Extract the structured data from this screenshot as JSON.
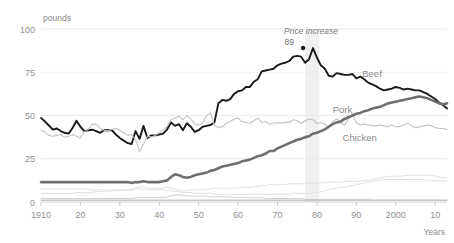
{
  "chart_data": {
    "type": "line",
    "title": "",
    "xlabel": "Years",
    "ylabel": "pounds",
    "xlim": [
      1910,
      2013
    ],
    "ylim": [
      0,
      100
    ],
    "grid": true,
    "legend": "inline-labels",
    "x_ticks": [
      {
        "value": 1910,
        "label": "1910"
      },
      {
        "value": 1920,
        "label": "20"
      },
      {
        "value": 1930,
        "label": "30"
      },
      {
        "value": 1940,
        "label": "40"
      },
      {
        "value": 1950,
        "label": "50"
      },
      {
        "value": 1960,
        "label": "60"
      },
      {
        "value": 1970,
        "label": "70"
      },
      {
        "value": 1980,
        "label": "80"
      },
      {
        "value": 1990,
        "label": "90"
      },
      {
        "value": 2000,
        "label": "2000"
      },
      {
        "value": 2010,
        "label": "10"
      }
    ],
    "y_ticks": [
      {
        "value": 0,
        "label": "0"
      },
      {
        "value": 25,
        "label": "25"
      },
      {
        "value": 50,
        "label": "50"
      },
      {
        "value": 75,
        "label": "75"
      },
      {
        "value": 100,
        "label": "100"
      }
    ],
    "annotations": [
      {
        "name": "price-increase",
        "text": "Price increase",
        "x": 1978.5,
        "y": 97,
        "style": "italic"
      },
      {
        "name": "beef-peak-value",
        "text": "89",
        "x": 1974.2,
        "y": 90.5,
        "marker": true,
        "marker_x": 1976.5,
        "marker_y": 89
      }
    ],
    "shaded_band": {
      "x_start": 1977.0,
      "x_end": 1980.6,
      "color": "#f0f0f0"
    },
    "series": [
      {
        "name": "Beef",
        "label": "Beef",
        "color": "#1a1a1a",
        "width": 1.9,
        "label_x": 1991.5,
        "label_y": 72.5,
        "values": [
          48.6,
          46.5,
          44.2,
          41.8,
          42.5,
          41.0,
          40.0,
          39.5,
          42.8,
          47.0,
          43.5,
          41.0,
          41.5,
          41.8,
          41.0,
          40.0,
          41.5,
          41.5,
          41.5,
          39.0,
          37.0,
          35.5,
          34.0,
          33.5,
          41.0,
          36.5,
          44.0,
          37.0,
          38.5,
          38.5,
          39.0,
          39.5,
          42.0,
          46.0,
          44.0,
          45.0,
          41.5,
          45.5,
          43.5,
          40.5,
          41.5,
          43.5,
          44.0,
          44.5,
          46.0,
          57.0,
          59.0,
          58.5,
          59.5,
          62.5,
          64.0,
          64.5,
          66.5,
          66.5,
          69.5,
          71.0,
          75.5,
          76.0,
          76.5,
          77.0,
          79.0,
          80.0,
          80.5,
          81.5,
          84.0,
          84.5,
          84.0,
          80.5,
          82.5,
          89.0,
          83.5,
          79.0,
          77.0,
          73.0,
          72.5,
          74.5,
          74.0,
          73.5,
          73.5,
          74.0,
          71.5,
          72.5,
          71.0,
          69.0,
          68.0,
          67.0,
          65.5,
          64.5,
          65.0,
          65.5,
          66.5,
          66.0,
          65.0,
          65.5,
          65.0,
          64.5,
          64.5,
          63.5,
          62.5,
          61.0,
          59.5,
          57.5,
          56.0,
          54.0
        ]
      },
      {
        "name": "Pork",
        "label": "Pork",
        "color": "#c2c2c2",
        "width": 1.1,
        "label_x": 1984.0,
        "label_y": 51.5,
        "values": [
          41.5,
          40.5,
          38.5,
          38.0,
          38.5,
          39.0,
          37.5,
          38.0,
          39.0,
          38.0,
          37.0,
          40.5,
          42.0,
          45.0,
          45.0,
          42.5,
          41.5,
          41.0,
          42.0,
          42.5,
          41.5,
          40.0,
          38.5,
          39.0,
          36.0,
          29.0,
          33.5,
          38.0,
          37.5,
          38.5,
          40.0,
          41.5,
          44.0,
          47.5,
          48.5,
          49.5,
          47.5,
          50.0,
          48.0,
          45.0,
          44.5,
          45.5,
          50.0,
          51.5,
          44.5,
          43.0,
          43.5,
          45.5,
          46.5,
          48.0,
          48.5,
          46.5,
          46.0,
          45.5,
          47.0,
          48.5,
          46.0,
          46.5,
          45.0,
          45.5,
          46.0,
          45.5,
          46.0,
          46.0,
          47.5,
          47.0,
          45.5,
          47.0,
          48.0,
          47.5,
          45.5,
          46.0,
          45.0,
          43.0,
          46.5,
          48.0,
          46.0,
          44.5,
          48.0,
          51.0,
          46.0,
          44.5,
          45.0,
          44.5,
          44.0,
          44.0,
          44.5,
          44.0,
          43.5,
          44.5,
          43.5,
          43.5,
          44.5,
          45.5,
          44.0,
          43.0,
          43.5,
          44.0,
          44.5,
          44.0,
          43.0,
          42.5,
          42.5,
          42.0
        ]
      },
      {
        "name": "Chicken",
        "label": "Chicken",
        "color": "#6e6e6e",
        "width": 2.6,
        "label_x": 1986.5,
        "label_y": 35.5,
        "values": [
          11.5,
          11.5,
          11.5,
          11.5,
          11.5,
          11.5,
          11.5,
          11.5,
          11.5,
          11.5,
          11.5,
          11.5,
          11.5,
          11.5,
          11.5,
          11.5,
          11.5,
          11.5,
          11.5,
          11.5,
          11.5,
          11.5,
          11.5,
          11.0,
          11.5,
          11.5,
          12.0,
          11.5,
          11.5,
          11.5,
          11.5,
          12.0,
          12.5,
          14.5,
          16.0,
          15.5,
          14.5,
          14.0,
          14.5,
          15.5,
          16.0,
          16.5,
          17.0,
          18.0,
          18.5,
          19.5,
          20.5,
          21.0,
          21.5,
          22.0,
          22.5,
          23.5,
          24.0,
          24.5,
          25.5,
          26.5,
          27.0,
          28.0,
          29.5,
          29.5,
          31.0,
          32.0,
          33.0,
          34.0,
          35.0,
          36.0,
          36.5,
          37.5,
          38.0,
          39.5,
          40.0,
          41.0,
          42.0,
          43.5,
          45.0,
          46.0,
          46.5,
          48.0,
          49.0,
          50.0,
          51.0,
          51.5,
          52.5,
          53.0,
          54.0,
          54.5,
          55.0,
          56.0,
          57.0,
          57.5,
          58.0,
          58.5,
          59.0,
          59.5,
          60.0,
          60.5,
          61.0,
          60.5,
          60.0,
          59.0,
          58.0,
          57.0,
          56.5,
          57.0
        ]
      },
      {
        "name": "minor-series-1",
        "label": "",
        "color": "#dcdcdc",
        "width": 0.9,
        "values": [
          7.5,
          7.5,
          7.5,
          7.5,
          7.5,
          7.5,
          7.5,
          7.5,
          7.5,
          7.5,
          7.5,
          7.5,
          7.5,
          7.0,
          7.0,
          7.0,
          7.0,
          7.0,
          7.0,
          7.0,
          7.0,
          7.0,
          7.0,
          7.0,
          8.5,
          8.5,
          9.0,
          8.0,
          8.0,
          8.0,
          8.0,
          8.0,
          8.5,
          8.0,
          7.5,
          7.0,
          6.5,
          6.5,
          7.0,
          7.0,
          7.0,
          7.0,
          7.5,
          7.5,
          8.0,
          8.0,
          8.0,
          8.0,
          8.0,
          8.0,
          8.0,
          8.5,
          8.5,
          8.5,
          9.0,
          9.0,
          9.5,
          9.5,
          10.0,
          10.0,
          10.0,
          10.0,
          10.0,
          10.5,
          10.5,
          10.5,
          10.5,
          11.0,
          11.0,
          11.0,
          11.0,
          11.0,
          11.0,
          11.5,
          11.5,
          11.5,
          11.5,
          12.0,
          12.0,
          12.0,
          12.0,
          12.0,
          12.5,
          12.5,
          13.0,
          13.5,
          14.0,
          14.5,
          14.5,
          15.0,
          15.0,
          15.0,
          15.0,
          15.5,
          15.5,
          15.5,
          15.5,
          15.5,
          15.5,
          15.5,
          15.0,
          14.5,
          14.0,
          14.0
        ]
      },
      {
        "name": "minor-series-2",
        "label": "",
        "color": "#dcdcdc",
        "width": 0.9,
        "values": [
          5.0,
          5.0,
          5.0,
          5.0,
          5.0,
          5.0,
          5.0,
          5.0,
          5.0,
          5.5,
          5.5,
          5.5,
          5.5,
          5.5,
          6.0,
          6.0,
          6.0,
          6.0,
          6.5,
          6.5,
          6.5,
          7.0,
          7.0,
          7.0,
          7.5,
          7.5,
          7.5,
          7.0,
          7.0,
          7.0,
          7.0,
          7.0,
          6.5,
          6.5,
          6.0,
          6.0,
          5.5,
          5.5,
          5.5,
          5.0,
          5.0,
          5.0,
          5.0,
          5.0,
          4.5,
          4.5,
          4.5,
          4.5,
          4.5,
          4.5,
          4.5,
          4.5,
          4.5,
          4.5,
          4.5,
          4.5,
          4.5,
          4.5,
          4.5,
          4.5,
          4.5,
          4.5,
          4.5,
          4.5,
          5.0,
          5.0,
          5.0,
          5.0,
          5.0,
          5.5,
          5.5,
          6.0,
          6.5,
          7.0,
          7.5,
          8.0,
          8.5,
          8.5,
          9.0,
          9.5,
          10.0,
          10.5,
          11.0,
          11.5,
          12.0,
          12.5,
          12.5,
          13.0,
          13.0,
          13.0,
          13.0,
          13.0,
          13.0,
          13.0,
          13.0,
          13.0,
          13.0,
          13.0,
          12.5,
          12.5,
          12.5,
          12.5,
          12.0,
          12.0
        ]
      },
      {
        "name": "minor-series-3",
        "label": "",
        "color": "#cfcfcf",
        "width": 1.0,
        "values": [
          2.0,
          2.0,
          2.0,
          2.0,
          2.0,
          2.0,
          2.0,
          2.0,
          2.0,
          2.0,
          2.0,
          2.0,
          2.0,
          2.0,
          2.0,
          2.0,
          2.0,
          2.0,
          2.0,
          2.0,
          2.0,
          2.0,
          2.0,
          2.0,
          2.5,
          2.5,
          2.5,
          2.5,
          2.5,
          2.5,
          2.5,
          2.5,
          3.0,
          3.5,
          4.0,
          4.0,
          4.0,
          3.5,
          3.5,
          3.5,
          3.5,
          3.5,
          3.5,
          3.0,
          3.0,
          3.0,
          3.0,
          3.0,
          3.0,
          2.5,
          2.5,
          2.5,
          2.5,
          2.5,
          2.5,
          2.5,
          2.5,
          2.0,
          2.0,
          2.0,
          2.0,
          2.0,
          2.0,
          2.0,
          2.0,
          2.0,
          2.0,
          1.5,
          1.5,
          1.5,
          1.5,
          1.5,
          1.5,
          1.5,
          1.5,
          1.5,
          1.5,
          1.5,
          1.5,
          1.5,
          1.5,
          1.5,
          1.5,
          1.5,
          1.0,
          1.0,
          1.0,
          1.0,
          1.0,
          1.0,
          1.0,
          1.0,
          1.0,
          1.0,
          1.0,
          1.0,
          1.0,
          1.0,
          1.0,
          1.0,
          1.0,
          1.0,
          1.0,
          1.0
        ]
      },
      {
        "name": "minor-series-4",
        "label": "",
        "color": "#c8c8c8",
        "width": 1.6,
        "values": [
          1.0,
          1.0,
          1.0,
          1.0,
          1.0,
          1.0,
          1.0,
          1.0,
          1.0,
          1.0,
          1.0,
          1.0,
          1.0,
          1.0,
          1.0,
          1.0,
          1.0,
          1.0,
          1.0,
          1.0,
          1.0,
          1.0,
          1.0,
          1.0,
          1.0,
          1.0,
          1.0,
          1.0,
          1.0,
          1.0,
          1.0,
          1.0,
          1.0,
          1.0,
          1.0,
          1.0,
          1.0,
          1.0,
          1.0,
          1.0,
          1.0,
          1.0,
          1.0,
          1.0,
          1.0,
          1.0,
          1.0,
          1.0,
          1.0,
          1.0,
          1.0,
          1.0,
          1.0,
          1.0,
          1.0,
          1.0,
          1.0,
          1.0,
          1.0,
          1.0,
          1.0,
          1.0,
          1.0,
          1.0,
          1.0,
          1.0,
          1.0,
          1.0,
          1.0,
          1.0,
          1.0,
          1.0,
          1.0,
          1.0,
          1.0,
          1.0,
          1.0,
          1.0,
          1.0,
          1.0,
          1.0,
          1.0,
          1.0,
          1.0,
          1.0,
          1.0,
          1.0,
          1.0,
          1.0,
          1.0,
          1.0,
          1.0,
          1.0,
          1.0,
          1.0,
          1.0,
          1.0,
          1.0,
          1.0,
          1.0,
          1.0,
          1.0,
          1.0,
          1.0
        ]
      }
    ]
  }
}
